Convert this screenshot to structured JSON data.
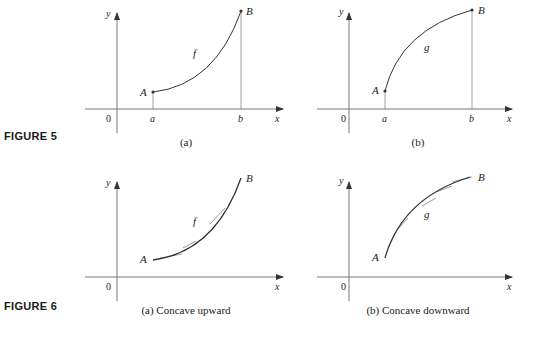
{
  "figures": [
    {
      "label": "FIGURE 5",
      "panels": [
        {
          "caption": "(a)",
          "origin_label": "0",
          "x_axis_label": "x",
          "y_axis_label": "y",
          "curve_label": "f",
          "start_point_label": "A",
          "end_point_label": "B",
          "tick_a_label": "a",
          "tick_b_label": "b",
          "shape": "increasing concave up"
        },
        {
          "caption": "(b)",
          "origin_label": "0",
          "x_axis_label": "x",
          "y_axis_label": "y",
          "curve_label": "g",
          "start_point_label": "A",
          "end_point_label": "B",
          "tick_a_label": "a",
          "tick_b_label": "b",
          "shape": "increasing concave down"
        }
      ]
    },
    {
      "label": "FIGURE 6",
      "panels": [
        {
          "caption": "(a) Concave upward",
          "origin_label": "0",
          "x_axis_label": "x",
          "y_axis_label": "y",
          "curve_label": "f",
          "start_point_label": "A",
          "end_point_label": "B",
          "shape": "concave up with tangent lines below curve"
        },
        {
          "caption": "(b) Concave downward",
          "origin_label": "0",
          "x_axis_label": "x",
          "y_axis_label": "y",
          "curve_label": "g",
          "start_point_label": "A",
          "end_point_label": "B",
          "shape": "concave down with tangent lines above curve"
        }
      ]
    }
  ],
  "colors": {
    "axis": "#555555",
    "curve": "#333333",
    "tangent": "#9a9a9a",
    "text": "#222222"
  }
}
